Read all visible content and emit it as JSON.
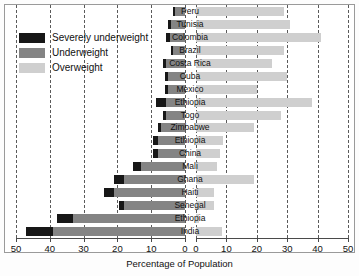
{
  "chart_data": {
    "type": "bar",
    "orientation": "horizontal",
    "subtype": "diverging-paired-stacked",
    "title": "",
    "xlabel": "Percentage of Population",
    "ylabel": "",
    "categories": [
      "Peru",
      "Tunisia",
      "Colombia",
      "Brazil",
      "Costa Rica",
      "Cuba",
      "Mexico",
      "Ethiopia",
      "Togo",
      "Zimbabwe",
      "Ethiopia",
      "China",
      "Mali",
      "Ghana",
      "Haiti",
      "Senegal",
      "Ethiopia",
      "India"
    ],
    "series": [
      {
        "name": "Severely underweight",
        "color": "#171717",
        "panel": "left",
        "values": [
          0.5,
          1,
          1,
          0.5,
          1,
          1,
          1,
          3,
          1,
          1,
          1.5,
          1.5,
          2.5,
          3,
          3,
          1.5,
          5,
          8
        ]
      },
      {
        "name": "Underweight",
        "color": "#848484",
        "panel": "left",
        "values": [
          3,
          4,
          4.5,
          3.5,
          5.5,
          5,
          5,
          5.5,
          5.5,
          7,
          8,
          8,
          13,
          18,
          21,
          18,
          33,
          39
        ]
      },
      {
        "name": "Overweight",
        "color": "#cfcfcf",
        "panel": "right",
        "values": [
          29,
          31,
          41,
          29,
          25,
          30,
          20,
          38,
          28,
          19,
          9,
          8,
          7,
          19,
          6,
          6,
          1,
          8.5
        ]
      }
    ],
    "left_axis": {
      "label": "",
      "ticks": [
        50,
        40,
        30,
        20,
        10,
        0
      ],
      "range": [
        50,
        0
      ],
      "direction": "reversed",
      "grid": true,
      "grid_style": "dashed"
    },
    "right_axis": {
      "label": "",
      "ticks": [
        0,
        10,
        20,
        30,
        40,
        50
      ],
      "range": [
        0,
        50
      ],
      "direction": "normal",
      "grid": true,
      "grid_style": "dashed"
    },
    "legend": {
      "position": "top-left",
      "entries": [
        "Severely underweight",
        "Underweight",
        "Overweight"
      ]
    },
    "note": "Left panel shows underweight (stacked severely underweight + underweight); right panel shows overweight."
  },
  "legend": {
    "entries": [
      {
        "label": "Severely underweight",
        "color": "#171717",
        "swatch_name": "legend-swatch-severely-underweight"
      },
      {
        "label": "Underweight",
        "color": "#848484",
        "swatch_name": "legend-swatch-underweight"
      },
      {
        "label": "Overweight",
        "color": "#cfcfcf",
        "swatch_name": "legend-swatch-overweight"
      }
    ]
  },
  "axis": {
    "xlabel": "Percentage of Population",
    "left_ticks": [
      "50",
      "40",
      "30",
      "20",
      "10",
      "0"
    ],
    "right_ticks": [
      "0",
      "10",
      "20",
      "30",
      "40",
      "50"
    ]
  },
  "countries": [
    {
      "name": "Peru"
    },
    {
      "name": "Tunisia"
    },
    {
      "name": "Colombia"
    },
    {
      "name": "Brazil"
    },
    {
      "name": "Costa Rica"
    },
    {
      "name": "Cuba"
    },
    {
      "name": "Mexico"
    },
    {
      "name": "Ethiopia"
    },
    {
      "name": "Togo"
    },
    {
      "name": "Zimbabwe"
    },
    {
      "name": "Ethiopia"
    },
    {
      "name": "China"
    },
    {
      "name": "Mali"
    },
    {
      "name": "Ghana"
    },
    {
      "name": "Haiti"
    },
    {
      "name": "Senegal"
    },
    {
      "name": "Ethiopia"
    },
    {
      "name": "India"
    }
  ]
}
